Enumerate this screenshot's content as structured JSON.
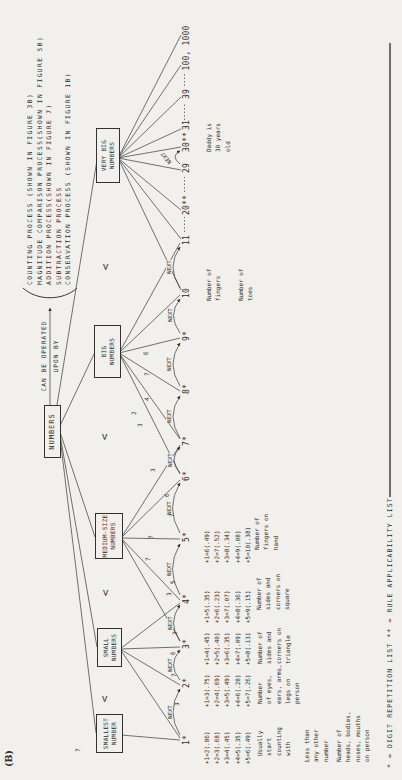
{
  "panel_label": "(B)",
  "processes": {
    "text": "COUNTING PROCESS (SHOWN IN FIGURE 3B)\nMAGNITUDE COMPARISON PROCESS(SHOWN IN FIGURE 5B)\nADDITION PROCESS(SHOWN IN FIGURE 7)\nSUBTRACTION PROCESS\nCONSERVATION PROCESS (SHOWN IN FIGURE 1B)"
  },
  "operated_by": {
    "line1": "CAN BE OPERATED",
    "line2": "UPON BY"
  },
  "root_label": "NUMBERS",
  "categories": [
    "SMALLEST\nNUMBER",
    "SMALL\nNUMBERS",
    "MEDIUM-SIZE\nNUMBERS",
    "BIG\nNUMBERS",
    "VERY BIG\nNUMBERS"
  ],
  "less_than": "<",
  "next_label": "NEXT",
  "nodes": [
    "1*",
    "2*",
    "3*",
    "4*",
    "5*",
    "6*",
    "7*",
    "8*",
    "9*",
    "10",
    "11",
    "20**",
    "29",
    "30**",
    "31",
    "39",
    "100, 1000"
  ],
  "edge_digits": [
    "7",
    "3",
    "7",
    "6",
    "2",
    "3",
    "5",
    "7",
    "7",
    "7",
    "6",
    "3",
    "3",
    "2",
    "4",
    "7",
    "6"
  ],
  "equations": [
    "+1=2(.86)\n+2=3(.68)\n+3=4(.45)\n+4=5(.35)\n+5=6(.49)",
    "+1=3(.75)\n+2=4(.69)\n+3=5(.49)\n+4=6(.28)\n+5=7(.26)",
    "+1=4(.45)\n+2=5(.40)\n+3=6(.35)\n+4=7(.09)\n+5=8(.13)",
    "+1=5(.35)\n+2=6(.23)\n+3=7(.07)\n+4=8(.36)\n+5=9(.15)",
    "+1=6(.49)\n+2=7(.52)\n+3=8(.34)\n+4=9(.08)\n+5=10(.38)"
  ],
  "annotations": {
    "one_usually": "Usually\nstart\ncounting\nwith",
    "one_less": "Less than\nany other\nnumber",
    "one_heads": "Number of\nheads, bodies,\nnoses, mouths\non person",
    "two_eyes": "Number\nof eyes,\nears, arms,\nlegs on\nperson",
    "three_triangle": "Number of\nsides and\ncorners on\ntriangle",
    "four_square": "Number of\nsides and\ncorners on\nsquare",
    "five_hand": "Number of\nfingers on\nhand",
    "ten_fingers": "Number of\nfingers",
    "ten_toes": "Number of\ntoes",
    "thirty_daddy": "Daddy is\n30 years\nold"
  },
  "footnote": "* = DIGIT REPETITION LIST      ** = RULE APPLICABILITY LIST",
  "colors": {
    "paper": "#f2f0ec",
    "ink": "#2e2c29"
  }
}
